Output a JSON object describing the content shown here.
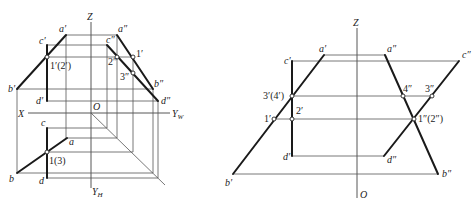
{
  "left_view": {
    "axes": {
      "z": "Z",
      "x": "X",
      "o": "O",
      "yw": "Y",
      "yw_sub": "W",
      "yh": "Y",
      "yh_sub": "H"
    },
    "front_labels": {
      "a": "a′",
      "c": "c′",
      "b": "b′",
      "d": "d′",
      "p12": "1′(2′)"
    },
    "side_labels": {
      "a": "a″",
      "c": "c″",
      "b": "b″",
      "d": "d″",
      "p2": "2″",
      "p1": "1′",
      "p3": "3″"
    },
    "top_labels": {
      "c": "c",
      "a": "a",
      "b": "b",
      "d": "d",
      "p13": "1(3)"
    }
  },
  "right_view": {
    "axes": {
      "z": "Z",
      "o": "O"
    },
    "front_labels": {
      "a": "a′",
      "c": "c′",
      "b": "b′",
      "d": "d′",
      "p34": "3′(4′)",
      "p1": "1′",
      "p2": "2′"
    },
    "side_labels": {
      "a": "a″",
      "c": "c″",
      "b": "b″",
      "d": "d″",
      "p4": "4″",
      "p3": "3″",
      "p12": "1″(2″)"
    }
  }
}
